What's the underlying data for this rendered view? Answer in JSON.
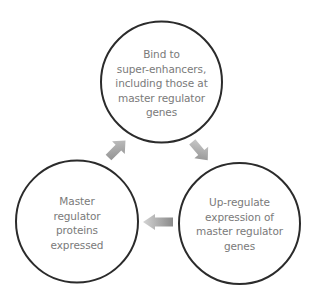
{
  "diagram": {
    "type": "cycle",
    "colors": {
      "circle_stroke": "#2b2b2b",
      "text": "#7a7a7a",
      "arrow_dark": "#8c8c8c",
      "arrow_light": "#d0d0d0"
    },
    "nodes": [
      {
        "id": "bind",
        "lines": [
          "Bind to",
          "super-enhancers,",
          "including those at",
          "master regulator",
          "genes"
        ]
      },
      {
        "id": "upregulate",
        "lines": [
          "Up-regulate",
          "expression of",
          "master regulator",
          "genes"
        ]
      },
      {
        "id": "expressed",
        "lines": [
          "Master",
          "regulator",
          "proteins",
          "expressed"
        ]
      }
    ],
    "edges": [
      {
        "from": "bind",
        "to": "upregulate",
        "direction": "down-right"
      },
      {
        "from": "upregulate",
        "to": "expressed",
        "direction": "left"
      },
      {
        "from": "expressed",
        "to": "bind",
        "direction": "up-right"
      }
    ]
  }
}
